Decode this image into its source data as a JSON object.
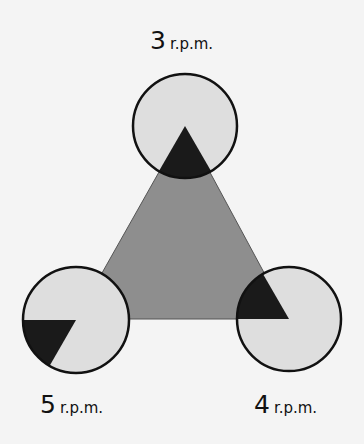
{
  "diagram": {
    "colors": {
      "background": "#f4f4f4",
      "triangle": "#8e8e8e",
      "circle_fill": "#dedede",
      "wedge": "#1a1a1a",
      "outline": "#111111"
    },
    "triangle": {
      "apex": [
        185,
        126
      ],
      "bottom_left": [
        76,
        319
      ],
      "bottom_right": [
        289,
        319
      ]
    },
    "circles": [
      {
        "id": "top",
        "center": [
          185,
          126
        ],
        "r": 52,
        "wedge_angles_deg": [
          60,
          120
        ]
      },
      {
        "id": "left",
        "center": [
          76,
          320
        ],
        "r": 53,
        "wedge_angles_deg": [
          120,
          180
        ]
      },
      {
        "id": "right",
        "center": [
          289,
          319
        ],
        "r": 52,
        "wedge_angles_deg": [
          180,
          240
        ]
      }
    ],
    "labels": {
      "top": {
        "number": "3",
        "unit": "r.p.m."
      },
      "left": {
        "number": "5",
        "unit": "r.p.m."
      },
      "right": {
        "number": "4",
        "unit": "r.p.m."
      }
    }
  }
}
